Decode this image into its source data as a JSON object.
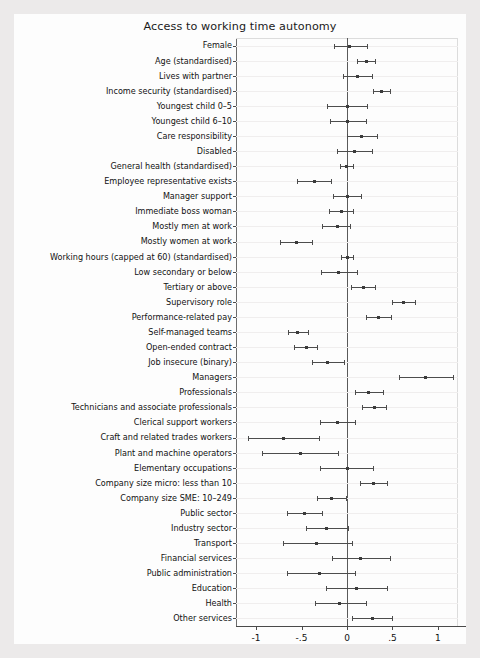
{
  "figure": {
    "title": "Access to working time autonomy",
    "background": "#fdfdfd",
    "page_background": "#eceaea",
    "marker_color": "#3b3b3b",
    "line_color": "#4d4d4d",
    "zero_line_color": "#5a5a5a"
  },
  "axis": {
    "ticks": [
      "-1",
      "-.5",
      "0",
      ".5",
      "1"
    ],
    "tick_values": [
      -1,
      -0.5,
      0,
      0.5,
      1
    ],
    "xmin": -1.22,
    "xmax": 1.22
  },
  "chart_data": {
    "type": "scatter",
    "title": "Access to working time autonomy",
    "xlabel": "",
    "ylabel": "",
    "xlim": [
      -1.22,
      1.22
    ],
    "grid": true,
    "legend": "none",
    "annotations": [
      "vertical reference line at 0"
    ],
    "xticks": [
      -1,
      -0.5,
      0,
      0.5,
      1
    ],
    "xticklabels": [
      "-1",
      "-.5",
      "0",
      ".5",
      "1"
    ],
    "categories": [
      "Female",
      "Age (standardised)",
      "Lives with partner",
      "Income security (standardised)",
      "Youngest child 0–5",
      "Youngest child 6–10",
      "Care responsibility",
      "Disabled",
      "General health (standardised)",
      "Employee representative exists",
      "Manager support",
      "Immediate boss woman",
      "Mostly men at work",
      "Mostly women at work",
      "Working hours (capped at 60) (standardised)",
      "Low secondary or below",
      "Tertiary or above",
      "Supervisory role",
      "Performance-related pay",
      "Self-managed teams",
      "Open-ended contract",
      "Job insecure (binary)",
      "Managers",
      "Professionals",
      "Technicians and associate professionals",
      "Clerical support workers",
      "Craft and related trades workers",
      "Plant and machine operators",
      "Elementary occupations",
      "Company size micro: less than 10",
      "Company size SME: 10–249",
      "Public sector",
      "Industry sector",
      "Transport",
      "Financial services",
      "Public administration",
      "Education",
      "Health",
      "Other services"
    ],
    "values": [
      0.03,
      0.21,
      0.12,
      0.38,
      0.0,
      0.01,
      0.16,
      0.08,
      -0.01,
      -0.36,
      0.0,
      -0.06,
      -0.1,
      -0.56,
      0.0,
      -0.09,
      0.18,
      0.62,
      0.35,
      -0.54,
      -0.45,
      -0.21,
      0.86,
      0.24,
      0.3,
      -0.1,
      -0.7,
      -0.51,
      0.0,
      0.29,
      -0.17,
      -0.47,
      -0.22,
      -0.34,
      0.15,
      -0.3,
      0.1,
      -0.08,
      0.28
    ],
    "ci_low": [
      -0.14,
      0.11,
      -0.04,
      0.29,
      -0.22,
      -0.19,
      0.0,
      -0.11,
      -0.08,
      -0.55,
      -0.15,
      -0.2,
      -0.28,
      -0.74,
      -0.07,
      -0.29,
      0.04,
      0.49,
      0.21,
      -0.65,
      -0.58,
      -0.38,
      0.57,
      0.09,
      0.17,
      -0.3,
      -1.09,
      -0.93,
      -0.3,
      0.14,
      -0.33,
      -0.66,
      -0.45,
      -0.7,
      -0.17,
      -0.66,
      -0.23,
      -0.35,
      0.06
    ],
    "ci_high": [
      0.22,
      0.31,
      0.28,
      0.47,
      0.22,
      0.21,
      0.33,
      0.28,
      0.07,
      -0.18,
      0.15,
      0.07,
      0.03,
      -0.38,
      0.07,
      0.11,
      0.31,
      0.75,
      0.48,
      -0.43,
      -0.33,
      -0.03,
      1.16,
      0.4,
      0.43,
      0.09,
      -0.31,
      -0.1,
      0.29,
      0.44,
      -0.01,
      -0.28,
      0.01,
      0.05,
      0.47,
      0.09,
      0.44,
      0.21,
      0.49
    ]
  }
}
